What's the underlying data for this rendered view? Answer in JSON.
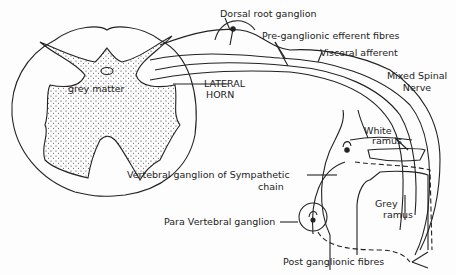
{
  "labels": {
    "dorsal_root_ganglion": "Dorsal root ganglion",
    "preganglionic": "Pre-ganglionic  efferent fibres",
    "visceral_afferent": "Visceral afferent",
    "mixed_spinal_1": "Mixed Spinal",
    "mixed_spinal_2": "Nerve",
    "grey_matter": "grey matter",
    "lateral_horn_1": "LATERAL",
    "lateral_horn_2": "HORN",
    "white_ramus_1": "White",
    "white_ramus_2": "ramus",
    "vertebral_ganglion_1": "Vertebral  ganglion of  Sympathetic",
    "vertebral_ganglion_2": "chain",
    "grey_ramus_1": "Grey",
    "grey_ramus_2": "ramus",
    "para_vertebral": "Para Vertebral  ganglion",
    "post_ganglionic": "Post ganglionic  fibres"
  }
}
